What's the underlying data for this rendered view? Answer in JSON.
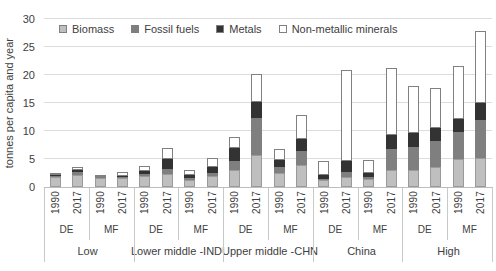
{
  "chart_data": {
    "type": "bar",
    "stacked": true,
    "title": "",
    "xlabel": "",
    "ylabel": "tonnes per capita and year",
    "ylim": [
      0,
      30
    ],
    "yticks": [
      0,
      5,
      10,
      15,
      20,
      25,
      30
    ],
    "grid": "horizontal",
    "legend_position": "top-inside",
    "units": "tonnes per capita and year",
    "series": [
      {
        "key": "biomass",
        "name": "Biomass",
        "color": "#bfbfbf"
      },
      {
        "key": "fossil_fuels",
        "name": "Fossil fuels",
        "color": "#7f7f7f"
      },
      {
        "key": "metals",
        "name": "Metals",
        "color": "#333333"
      },
      {
        "key": "non_metallic",
        "name": "Non-metallic minerals",
        "color": "#ffffff"
      }
    ],
    "groups": [
      {
        "label": "Low",
        "subgroups": [
          {
            "label": "DE",
            "bars": [
              {
                "year": "1990",
                "values": {
                  "biomass": 1.8,
                  "fossil_fuels": 0.25,
                  "metals": 0.1,
                  "non_metallic": 0.05
                }
              },
              {
                "year": "2017",
                "values": {
                  "biomass": 2.2,
                  "fossil_fuels": 0.45,
                  "metals": 0.4,
                  "non_metallic": 0.6
                }
              }
            ]
          },
          {
            "label": "MF",
            "bars": [
              {
                "year": "1990",
                "values": {
                  "biomass": 1.6,
                  "fossil_fuels": 0.2,
                  "metals": 0.05,
                  "non_metallic": 0.05
                }
              },
              {
                "year": "2017",
                "values": {
                  "biomass": 1.6,
                  "fossil_fuels": 0.2,
                  "metals": 0.1,
                  "non_metallic": 0.7
                }
              }
            ]
          }
        ]
      },
      {
        "label": "Lower middle -IND",
        "subgroups": [
          {
            "label": "DE",
            "bars": [
              {
                "year": "1990",
                "values": {
                  "biomass": 1.9,
                  "fossil_fuels": 0.35,
                  "metals": 0.7,
                  "non_metallic": 0.75
                }
              },
              {
                "year": "2017",
                "values": {
                  "biomass": 2.35,
                  "fossil_fuels": 0.95,
                  "metals": 1.75,
                  "non_metallic": 2.0
                }
              }
            ]
          },
          {
            "label": "MF",
            "bars": [
              {
                "year": "1990",
                "values": {
                  "biomass": 1.3,
                  "fossil_fuels": 0.25,
                  "metals": 0.6,
                  "non_metallic": 0.9
                }
              },
              {
                "year": "2017",
                "values": {
                  "biomass": 1.9,
                  "fossil_fuels": 0.6,
                  "metals": 1.0,
                  "non_metallic": 1.6
                }
              }
            ]
          }
        ]
      },
      {
        "label": "Upper middle -CHN",
        "subgroups": [
          {
            "label": "DE",
            "bars": [
              {
                "year": "1990",
                "values": {
                  "biomass": 3.1,
                  "fossil_fuels": 1.6,
                  "metals": 2.2,
                  "non_metallic": 2.1
                }
              },
              {
                "year": "2017",
                "values": {
                  "biomass": 5.8,
                  "fossil_fuels": 6.6,
                  "metals": 2.8,
                  "non_metallic": 4.9
                }
              }
            ]
          },
          {
            "label": "MF",
            "bars": [
              {
                "year": "1990",
                "values": {
                  "biomass": 2.5,
                  "fossil_fuels": 1.1,
                  "metals": 1.3,
                  "non_metallic": 1.9
                }
              },
              {
                "year": "2017",
                "values": {
                  "biomass": 4.0,
                  "fossil_fuels": 2.4,
                  "metals": 2.2,
                  "non_metallic": 4.2
                }
              }
            ]
          }
        ]
      },
      {
        "label": "China",
        "subgroups": [
          {
            "label": "DE",
            "bars": [
              {
                "year": "1990",
                "values": {
                  "biomass": 1.2,
                  "fossil_fuels": 0.3,
                  "metals": 0.6,
                  "non_metallic": 2.5
                }
              },
              {
                "year": "2017",
                "values": {
                  "biomass": 1.7,
                  "fossil_fuels": 0.95,
                  "metals": 2.05,
                  "non_metallic": 16.2
                }
              }
            ]
          },
          {
            "label": "MF",
            "bars": [
              {
                "year": "1990",
                "values": {
                  "biomass": 1.5,
                  "fossil_fuels": 0.3,
                  "metals": 0.7,
                  "non_metallic": 2.3
                }
              },
              {
                "year": "2017",
                "values": {
                  "biomass": 3.1,
                  "fossil_fuels": 3.7,
                  "metals": 2.4,
                  "non_metallic": 12.1
                }
              }
            ]
          }
        ]
      },
      {
        "label": "High",
        "subgroups": [
          {
            "label": "DE",
            "bars": [
              {
                "year": "1990",
                "values": {
                  "biomass": 3.1,
                  "fossil_fuels": 4.1,
                  "metals": 2.4,
                  "non_metallic": 8.45
                }
              },
              {
                "year": "2017",
                "values": {
                  "biomass": 3.6,
                  "fossil_fuels": 4.6,
                  "metals": 2.4,
                  "non_metallic": 7.1
                }
              }
            ]
          },
          {
            "label": "MF",
            "bars": [
              {
                "year": "1990",
                "values": {
                  "biomass": 5.0,
                  "fossil_fuels": 4.75,
                  "metals": 2.4,
                  "non_metallic": 9.4
                }
              },
              {
                "year": "2017",
                "values": {
                  "biomass": 5.2,
                  "fossil_fuels": 6.8,
                  "metals": 3.0,
                  "non_metallic": 12.8
                }
              }
            ]
          }
        ]
      }
    ],
    "style": {
      "gridline_color": "#dcdcdc",
      "axis_line_color": "#bdbdbd",
      "text_color": "#404040",
      "background": "#ffffff"
    }
  },
  "legend": {
    "items": [
      {
        "label": "Biomass"
      },
      {
        "label": "Fossil fuels"
      },
      {
        "label": "Metals"
      },
      {
        "label": "Non-metallic minerals"
      }
    ]
  }
}
